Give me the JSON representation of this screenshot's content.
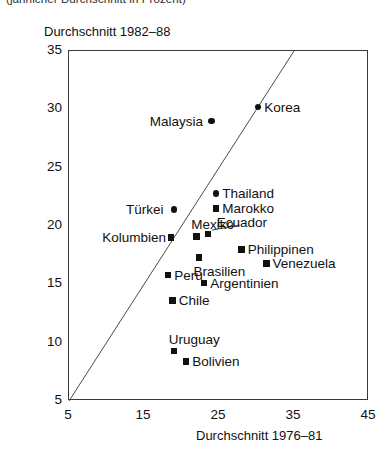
{
  "caption": "(jährlicher Durchschnitt in Prozent)",
  "chart_data": {
    "type": "scatter",
    "title": "",
    "xlabel": "Durchschnitt 1976–81",
    "ylabel": "Durchschnitt 1982–88",
    "xlim": [
      5,
      45
    ],
    "ylim": [
      5,
      35
    ],
    "xticks": [
      5,
      15,
      25,
      35,
      45
    ],
    "yticks": [
      5,
      10,
      15,
      20,
      25,
      30,
      35
    ],
    "grid": false,
    "legend": "none",
    "reference_line": {
      "name": "identity-line",
      "from": [
        5,
        5
      ],
      "to": [
        35,
        35
      ],
      "description": "45-Grad-Linie y = x"
    },
    "points": [
      {
        "label": "Korea",
        "x": 30.2,
        "y": 30.2,
        "marker": "circle",
        "label_pos": "right"
      },
      {
        "label": "Malaysia",
        "x": 24.0,
        "y": 29.0,
        "marker": "circle",
        "label_pos": "left"
      },
      {
        "label": "Thailand",
        "x": 24.6,
        "y": 22.8,
        "marker": "circle",
        "label_pos": "right"
      },
      {
        "label": "Marokko",
        "x": 24.6,
        "y": 21.5,
        "marker": "square",
        "label_pos": "right"
      },
      {
        "label": "Türkei",
        "x": 19.0,
        "y": 21.4,
        "marker": "circle",
        "label_pos": "left"
      },
      {
        "label": "Mexiko",
        "x": 22.0,
        "y": 19.1,
        "marker": "square",
        "label_pos": "above"
      },
      {
        "label": "Ecuador",
        "x": 23.5,
        "y": 19.3,
        "marker": "square",
        "label_pos": "above-leader"
      },
      {
        "label": "Kolumbien",
        "x": 18.6,
        "y": 19.0,
        "marker": "square",
        "label_pos": "left"
      },
      {
        "label": "Philippinen",
        "x": 28.0,
        "y": 18.0,
        "marker": "square",
        "label_pos": "right"
      },
      {
        "label": "Venezuela",
        "x": 31.3,
        "y": 16.8,
        "marker": "square",
        "label_pos": "right"
      },
      {
        "label": "Brasilien",
        "x": 22.3,
        "y": 17.3,
        "marker": "square",
        "label_pos": "below"
      },
      {
        "label": "Peru",
        "x": 18.2,
        "y": 15.8,
        "marker": "square",
        "label_pos": "right"
      },
      {
        "label": "Argentinien",
        "x": 23.0,
        "y": 15.1,
        "marker": "square",
        "label_pos": "right"
      },
      {
        "label": "Chile",
        "x": 18.8,
        "y": 13.6,
        "marker": "square",
        "label_pos": "right"
      },
      {
        "label": "Uruguay",
        "x": 19.0,
        "y": 9.3,
        "marker": "square",
        "label_pos": "above"
      },
      {
        "label": "Bolivien",
        "x": 20.6,
        "y": 8.4,
        "marker": "square",
        "label_pos": "right"
      }
    ]
  }
}
